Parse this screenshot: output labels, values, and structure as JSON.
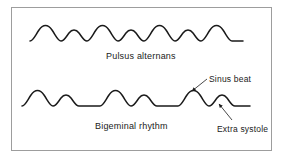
{
  "figure": {
    "title_visible": false,
    "background_color": "#ffffff",
    "frame_color": "#9d9d9d",
    "stroke_color": "#1a1a1a"
  },
  "traces": [
    {
      "id": "pulsus-alternans",
      "label": "Pulsus alternans",
      "description": "Regular rhythm with alternating strong and weak pulse amplitudes",
      "path": "M 30 41 C 33 41 35 36 39 30 C 43 24 48 24 52 30 C 56 36 58 41 61 41 C 64 41 66 37 69 33 C 72 29 76 29 79 33 C 82 37 84 41 87 41 C 90 41 92 36 96 30 C 100 24 105 24 109 30 C 113 36 115 41 118 41 C 121 41 123 37 126 33 C 129 29 133 29 136 33 C 139 37 141 41 144 41 C 147 41 149 36 153 30 C 157 24 162 24 166 30 C 170 36 172 41 175 41 C 178 41 180 37 183 33 C 186 29 190 29 193 33 C 196 37 198 41 201 41 C 204 41 206 36 210 30 C 214 24 219 24 223 30 C 227 36 229 41 232 41 C 235 41 239 41 243 41",
      "label_position": {
        "x": 106,
        "y": 51
      }
    },
    {
      "id": "bigeminal-rhythm",
      "label": "Bigeminal rhythm",
      "description": "Paired beats: a sinus beat followed by a premature extra systole, then a compensatory pause",
      "path": "M 22 106 C 25 106 27 101 31 95 C 35 89 40 89 44 95 C 48 101 50 106 53 106 C 56 106 58 102 61 98 C 64 94 68 94 71 98 C 74 102 76 106 79 106 L 100 106 C 103 106 105 101 109 95 C 113 89 118 89 122 95 C 126 101 128 106 131 106 C 134 106 136 102 139 98 C 142 94 146 94 149 98 C 152 102 154 106 157 106 L 178 106 C 181 106 183 101 187 95 C 191 89 196 89 200 95 C 204 101 206 106 209 106 C 212 106 214 102 217 98 C 220 94 224 94 227 98 C 230 102 232 106 235 106 L 250 106",
      "label_position": {
        "x": 95,
        "y": 121
      }
    }
  ],
  "callouts": [
    {
      "id": "sinus-beat",
      "label": "Sinus beat",
      "label_position": {
        "x": 209,
        "y": 74
      },
      "leader_path": "M 207 79 L 192 91",
      "arrow_tip": {
        "x": 191,
        "y": 92
      },
      "points_to": "tall rounded sinus beat peak on bigeminal trace"
    },
    {
      "id": "extra-systole",
      "label": "Extra systole",
      "label_position": {
        "x": 217,
        "y": 124
      },
      "leader_path": "M 232 120 L 219 104",
      "arrow_tip": {
        "x": 218,
        "y": 103
      },
      "points_to": "small premature extra systole peak on bigeminal trace"
    }
  ]
}
